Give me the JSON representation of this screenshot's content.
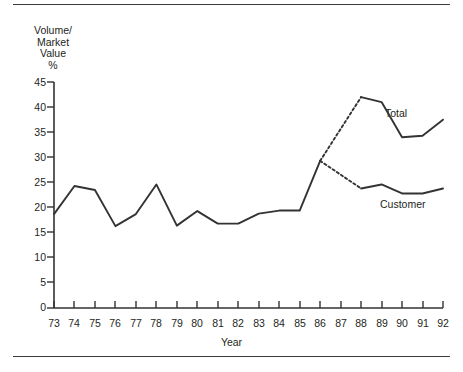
{
  "chart_data": {
    "type": "line",
    "title": "",
    "ylabel": "Volume/\nMarket\nValue\n%",
    "xlabel": "Year",
    "ylim": [
      0,
      45
    ],
    "ytick_values": [
      0,
      5,
      10,
      15,
      20,
      25,
      30,
      35,
      40,
      45
    ],
    "ytick_labels": [
      "0",
      "5",
      "10",
      "15",
      "20",
      "25",
      "30",
      "35",
      "40",
      "45"
    ],
    "grid": false,
    "legend_position": "inline-right",
    "categories": [
      "73",
      "74",
      "75",
      "76",
      "77",
      "78",
      "79",
      "80",
      "81",
      "82",
      "83",
      "84",
      "85",
      "86",
      "87",
      "88",
      "89",
      "90",
      "91",
      "92"
    ],
    "x": [
      73,
      74,
      75,
      76,
      77,
      78,
      79,
      80,
      81,
      82,
      83,
      84,
      85,
      86,
      87,
      88,
      89,
      90,
      91,
      92
    ],
    "series": [
      {
        "name": "Total",
        "label": "Total",
        "color": "#333333",
        "style": "solid-with-dashed-gap",
        "values": [
          18.7,
          24.3,
          23.5,
          16.3,
          18.7,
          24.6,
          16.4,
          19.3,
          16.8,
          16.8,
          18.8,
          19.4,
          19.4,
          29.3,
          null,
          42.0,
          41.0,
          34.0,
          34.3,
          37.5
        ],
        "dashed_segment_x": [
          86,
          88
        ],
        "dashed_segment_values": [
          29.3,
          42.0
        ]
      },
      {
        "name": "Customer",
        "label": "Customer",
        "color": "#333333",
        "style": "solid-with-dashed-gap",
        "values": [
          18.7,
          24.3,
          23.5,
          16.3,
          18.7,
          24.6,
          16.4,
          19.3,
          16.8,
          16.8,
          18.8,
          19.4,
          19.4,
          29.3,
          null,
          23.8,
          24.6,
          22.8,
          22.8,
          23.8
        ],
        "dashed_segment_x": [
          86,
          88
        ],
        "dashed_segment_values": [
          29.3,
          23.8
        ]
      }
    ],
    "shared_segment_note": "Series coincide from 73 through 86, then split"
  },
  "labels": {
    "total": "Total",
    "customer": "Customer"
  }
}
